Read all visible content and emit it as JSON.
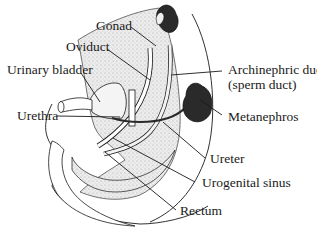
{
  "figure": {
    "type": "anatomical-diagram",
    "labels": {
      "gonad": "Gonad",
      "oviduct": "Oviduct",
      "urinary_bladder": "Urinary bladder",
      "urethra": "Urethra",
      "archinephric_duct": "Archinephric duct",
      "archinephric_duct_alt": "(sperm duct)",
      "metanephros": "Metanephros",
      "ureter": "Ureter",
      "urogenital_sinus": "Urogenital sinus",
      "rectum": "Rectum"
    },
    "colors": {
      "ink": "#1a1a1a",
      "stipple": "#d8d8d8",
      "organ_dark": "#2a2a2a",
      "background": "#ffffff"
    }
  }
}
